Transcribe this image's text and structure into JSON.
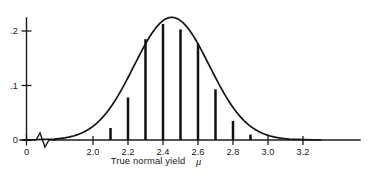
{
  "chart_data": {
    "type": "line",
    "title": "",
    "subtitle": "",
    "xlabel": "True normal yield",
    "xlabel_symbol": "μ",
    "ylabel": "",
    "xlim": [
      0,
      3.3
    ],
    "ylim": [
      0,
      0.245
    ],
    "grid": false,
    "legend": null,
    "x_ticks": [
      {
        "value": 0,
        "label": "0"
      },
      {
        "value": 2.0,
        "label": "2.0"
      },
      {
        "value": 2.2,
        "label": "2.2"
      },
      {
        "value": 2.4,
        "label": "2.4"
      },
      {
        "value": 2.6,
        "label": "2.6"
      },
      {
        "value": 2.8,
        "label": "2.8"
      },
      {
        "value": 3.0,
        "label": "3.0"
      },
      {
        "value": 3.2,
        "label": "3.2"
      }
    ],
    "y_ticks": [
      {
        "value": 0.0,
        "label": "0"
      },
      {
        "value": 0.1,
        "label": ".1"
      },
      {
        "value": 0.2,
        "label": ".2"
      }
    ],
    "axis_break": {
      "present": true,
      "between": [
        0.1,
        1.85
      ],
      "style": "zigzag"
    },
    "series": [
      {
        "name": "normal density curve",
        "type": "line",
        "mean": 2.45,
        "sigma": 0.215,
        "peak": 0.225,
        "x_start": 1.78,
        "x_end": 3.12
      },
      {
        "name": "discrete posterior spikes",
        "type": "needle",
        "x": [
          2.1,
          2.2,
          2.3,
          2.4,
          2.5,
          2.6,
          2.7,
          2.8,
          2.9
        ],
        "values": [
          0.022,
          0.078,
          0.185,
          0.213,
          0.203,
          0.177,
          0.093,
          0.035,
          0.01
        ]
      }
    ]
  }
}
